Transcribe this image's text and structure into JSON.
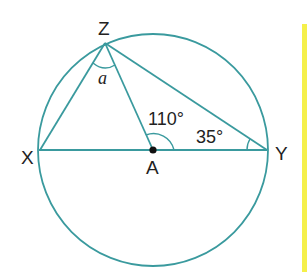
{
  "diagram": {
    "colors": {
      "line": "#3a9a9e",
      "text": "#222222",
      "accent_bar": "#f5f04a"
    },
    "points": {
      "Z": {
        "label": "Z"
      },
      "X": {
        "label": "X"
      },
      "Y": {
        "label": "Y"
      },
      "A": {
        "label": "A"
      }
    },
    "angles": {
      "at_Z": "a",
      "at_A": "110°",
      "at_Y": "35°"
    }
  }
}
